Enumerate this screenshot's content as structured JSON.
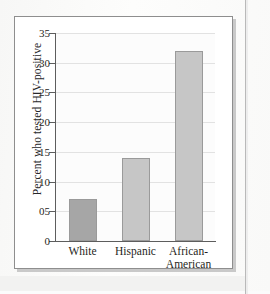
{
  "figure": {
    "frame_border_color": "#8e8e8e",
    "shadow_color": "#c9c9c9",
    "page_background": "#fbfbfb"
  },
  "chart_data": {
    "type": "bar",
    "title": "",
    "subtitle": "",
    "xlabel": "",
    "ylabel": "Percent who tested HIV-positive",
    "categories": [
      "White",
      "Hispanic",
      "African-American"
    ],
    "category_lines": [
      [
        "White"
      ],
      [
        "Hispanic"
      ],
      [
        "African-",
        "American"
      ]
    ],
    "values": [
      7,
      14,
      32
    ],
    "ylim": [
      0,
      35
    ],
    "ytick_values": [
      0,
      5,
      10,
      15,
      20,
      25,
      30,
      35
    ],
    "ytick_labels": [
      "0",
      "05",
      "10",
      "15",
      "20",
      "25",
      "30",
      "35"
    ],
    "grid": "horizontal",
    "legend": "none",
    "bar_colors": [
      "#a6a6a6",
      "#c6c6c6",
      "#c6c6c6"
    ],
    "bar_edge_color": "#9a9a9a",
    "gridline_color": "#e2e2e2",
    "axis_color": "#5d5d5d",
    "plot_background": "#fcfcfc"
  }
}
